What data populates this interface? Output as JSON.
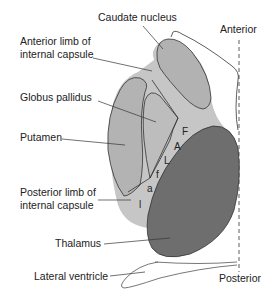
{
  "labels": {
    "caudate": "Caudate nucleus",
    "anterior_limb_1": "Anterior limb of",
    "anterior_limb_2": "internal capsule",
    "globus": "Globus pallidus",
    "putamen": "Putamen",
    "posterior_limb_1": "Posterior limb of",
    "posterior_limb_2": "internal capsule",
    "thalamus": "Thalamus",
    "ventricle": "Lateral ventricle",
    "anterior": "Anterior",
    "posterior": "Posterior"
  },
  "capsule_letters": [
    "F",
    "A",
    "L",
    "f",
    "a",
    "l"
  ],
  "colors": {
    "light_gray": "#bdbdbd",
    "caudate_gray": "#b4b4b4",
    "thalamus_gray": "#6e6e6e",
    "outline": "#333333"
  }
}
